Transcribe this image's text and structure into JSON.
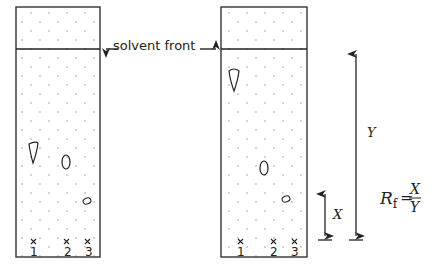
{
  "diagram": {
    "type": "paper chromatography",
    "labels": {
      "solvent_front": "solvent front",
      "distance_spot": "X",
      "distance_solvent": "Y"
    },
    "formula": {
      "lhs": "R",
      "subscript": "f",
      "equals": "=",
      "numerator": "X",
      "denominator": "Y"
    },
    "spot_labels": [
      "1",
      "2",
      "3"
    ],
    "spot_marker": "×",
    "colors": {
      "ink": "#222222",
      "dot": "#888888",
      "background": "#ffffff"
    }
  }
}
